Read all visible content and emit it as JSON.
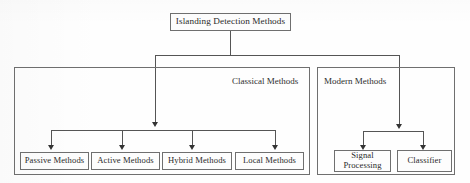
{
  "diagram": {
    "root": {
      "label": "Islanding Detection Methods"
    },
    "groups": [
      {
        "id": "classical",
        "label": "Classical Methods",
        "children": [
          {
            "id": "passive",
            "label": "Passive Methods"
          },
          {
            "id": "active",
            "label": "Active Methods"
          },
          {
            "id": "hybrid",
            "label": "Hybrid Methods"
          },
          {
            "id": "local",
            "label": "Local Methods"
          }
        ]
      },
      {
        "id": "modern",
        "label": "Modern Methods",
        "children": [
          {
            "id": "signal-processing",
            "label_line1": "Signal",
            "label_line2": "Processing"
          },
          {
            "id": "classifier",
            "label": "Classifier"
          }
        ]
      }
    ],
    "colors": {
      "box_border": "#6f6f6f",
      "connector": "#555555",
      "text": "#2a2a2a",
      "background": "#fefefe"
    }
  }
}
